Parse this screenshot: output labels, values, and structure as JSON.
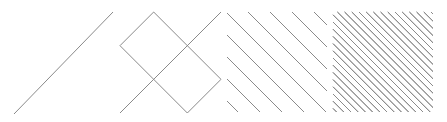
{
  "diagram": {
    "description": "Four square panels showing diagonal cross-hatch patterns of increasing density",
    "stroke_color": "#8a8a8a",
    "background": "#ffffff",
    "panels": [
      {
        "label": "single-diagonal",
        "x": 14,
        "y": 12,
        "size": 100,
        "period": 0,
        "mode": "single"
      },
      {
        "label": "coarse-lattice",
        "x": 120,
        "y": 12,
        "size": 101,
        "period": 67,
        "offset": 0,
        "mode": "lattice"
      },
      {
        "label": "medium-lattice",
        "x": 227,
        "y": 12,
        "size": 100,
        "period": 22,
        "offset": 0,
        "mode": "lattice"
      },
      {
        "label": "fine-lattice",
        "x": 333,
        "y": 12,
        "size": 100,
        "period": 7.2,
        "offset": 0,
        "mode": "lattice"
      }
    ]
  }
}
